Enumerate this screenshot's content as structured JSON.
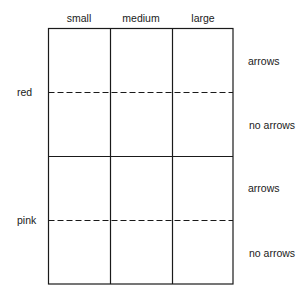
{
  "diagram": {
    "columns": [
      "small",
      "medium",
      "large"
    ],
    "rows": [
      "red",
      "pink"
    ],
    "sub_rows": [
      "arrows",
      "no arrows",
      "arrows",
      "no arrows"
    ],
    "line_color": "#1a1a1a"
  }
}
